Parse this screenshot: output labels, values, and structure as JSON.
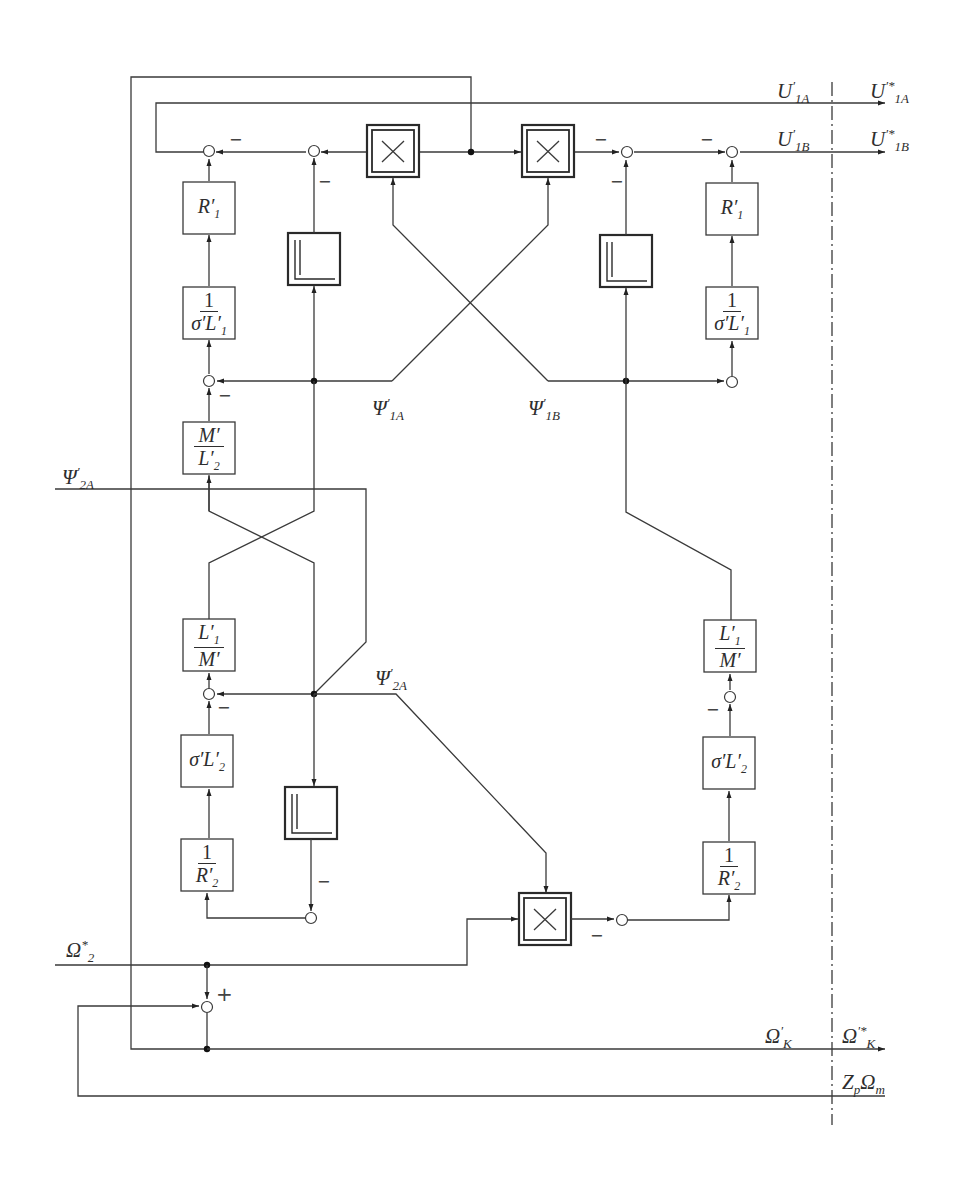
{
  "diagram": {
    "title": "",
    "signals": {
      "u1a": {
        "base": "U",
        "prime": "′",
        "sub": "1A"
      },
      "u1a_star": {
        "base": "U",
        "prime": "′*",
        "sub": "1A"
      },
      "u1b": {
        "base": "U",
        "prime": "′",
        "sub": "1B"
      },
      "u1b_star": {
        "base": "U",
        "prime": "′*",
        "sub": "1B"
      },
      "psi1a": {
        "base": "Ψ",
        "prime": "′",
        "sub": "1A"
      },
      "psi1b": {
        "base": "Ψ",
        "prime": "′",
        "sub": "1B"
      },
      "psi2a_in": {
        "base": "Ψ",
        "prime": "′",
        "sub": "2A"
      },
      "psi2a": {
        "base": "Ψ",
        "prime": "′",
        "sub": "2A"
      },
      "omega2_star": {
        "base": "Ω",
        "prime": "*",
        "sub": "2"
      },
      "omegak": {
        "base": "Ω",
        "prime": "′",
        "sub": "K"
      },
      "omegak_star": {
        "base": "Ω",
        "prime": "′*",
        "sub": "K"
      },
      "zp_omega_m": {
        "base": "Z",
        "sub1": "p",
        "base2": "Ω",
        "sub2": "m"
      }
    },
    "blocks": {
      "r1_left": {
        "num": "R′",
        "sub": "1"
      },
      "r1_right": {
        "num": "R′",
        "sub": "1"
      },
      "inv_sigma_l1_left": {
        "num": "1",
        "den": "σ′L′",
        "den_sub": "1"
      },
      "inv_sigma_l1_right": {
        "num": "1",
        "den": "σ′L′",
        "den_sub": "1"
      },
      "m_over_l2": {
        "num": "M′",
        "den": "L′",
        "den_sub": "2"
      },
      "l1_over_m_left": {
        "num": "L′",
        "num_sub": "1",
        "den": "M′"
      },
      "l1_over_m_right": {
        "num": "L′",
        "num_sub": "1",
        "den": "M′"
      },
      "sigma_l2_left": {
        "num": "σ′L′",
        "sub": "2"
      },
      "sigma_l2_right": {
        "num": "σ′L′",
        "sub": "2"
      },
      "inv_r2_left": {
        "num": "1",
        "den": "R′",
        "den_sub": "2"
      },
      "inv_r2_right": {
        "num": "1",
        "den": "R′",
        "den_sub": "2"
      },
      "integrator_symbol": "integrator",
      "multiplier_symbol": "×"
    },
    "signs": {
      "minus": "−",
      "plus": "+"
    },
    "colors": {
      "line": "#3a3a3a",
      "background": "#ffffff"
    }
  }
}
